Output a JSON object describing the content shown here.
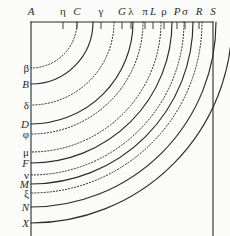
{
  "figure": {
    "background_color": "#fbfbf9",
    "ink_color": "#2b2b2b",
    "center": {
      "x": 31,
      "y": 22
    },
    "frame": {
      "left": 31,
      "top": 22,
      "right": 213,
      "bottom": 236
    }
  },
  "top_axis": {
    "name": "top-horizontal-line",
    "origin_label": "A",
    "labels": [
      {
        "text": "A",
        "x": 31,
        "tick": false,
        "style": "latin"
      },
      {
        "text": "η",
        "x": 63,
        "tick": true,
        "style": "greek"
      },
      {
        "text": "C",
        "x": 77,
        "tick": true,
        "style": "latin"
      },
      {
        "text": "γ",
        "x": 101,
        "tick": true,
        "style": "greek"
      },
      {
        "text": "G",
        "x": 122,
        "tick": true,
        "style": "latin"
      },
      {
        "text": "λ",
        "x": 131,
        "tick": true,
        "style": "greek"
      },
      {
        "text": "π",
        "x": 145,
        "tick": true,
        "style": "greek"
      },
      {
        "text": "L",
        "x": 153,
        "tick": true,
        "style": "latin"
      },
      {
        "text": "ρ",
        "x": 164,
        "tick": true,
        "style": "greek"
      },
      {
        "text": "P",
        "x": 177,
        "tick": true,
        "style": "latin"
      },
      {
        "text": "σ",
        "x": 185,
        "tick": true,
        "style": "greek"
      },
      {
        "text": "R",
        "x": 199,
        "tick": true,
        "style": "latin"
      },
      {
        "text": "S",
        "x": 213,
        "tick": false,
        "style": "latin"
      }
    ]
  },
  "left_axis": {
    "name": "left-vertical-line",
    "labels": [
      {
        "text": "β",
        "y": 68,
        "style": "greek"
      },
      {
        "text": "B",
        "y": 84,
        "style": "latin"
      },
      {
        "text": "δ",
        "y": 105,
        "style": "greek"
      },
      {
        "text": "D",
        "y": 124,
        "style": "latin"
      },
      {
        "text": "φ",
        "y": 134,
        "style": "greek"
      },
      {
        "text": "μ",
        "y": 152,
        "style": "greek"
      },
      {
        "text": "F",
        "y": 163,
        "style": "latin"
      },
      {
        "text": "ν",
        "y": 175,
        "style": "greek"
      },
      {
        "text": "M",
        "y": 184,
        "style": "latin"
      },
      {
        "text": "ξ",
        "y": 193,
        "style": "greek"
      },
      {
        "text": "N",
        "y": 207,
        "style": "latin"
      },
      {
        "text": "X",
        "y": 223,
        "style": "latin"
      }
    ]
  },
  "arcs": [
    {
      "name": "arc-beta",
      "radius": 46,
      "dash": "dotted",
      "top_label": "η",
      "left_label": "β"
    },
    {
      "name": "arc-B",
      "radius": 62,
      "dash": "solid",
      "top_label": "C",
      "left_label": "B"
    },
    {
      "name": "arc-delta",
      "radius": 83,
      "dash": "dotted",
      "top_label": "γ",
      "left_label": "δ"
    },
    {
      "name": "arc-D",
      "radius": 102,
      "dash": "solid",
      "top_label": "G",
      "left_label": "D"
    },
    {
      "name": "arc-phi",
      "radius": 112,
      "dash": "dotted",
      "top_label": "λ",
      "left_label": "φ"
    },
    {
      "name": "arc-mu",
      "radius": 130,
      "dash": "dotted",
      "top_label": "π",
      "left_label": "μ"
    },
    {
      "name": "arc-F",
      "radius": 141,
      "dash": "solid",
      "top_label": "L",
      "left_label": "F"
    },
    {
      "name": "arc-nu",
      "radius": 153,
      "dash": "dotted",
      "top_label": "ρ",
      "left_label": "ν"
    },
    {
      "name": "arc-M",
      "radius": 162,
      "dash": "solid",
      "top_label": "P",
      "left_label": "M"
    },
    {
      "name": "arc-xi",
      "radius": 171,
      "dash": "dotted",
      "top_label": "σ",
      "left_label": "ξ"
    },
    {
      "name": "arc-N",
      "radius": 185,
      "dash": "solid",
      "top_label": "R",
      "left_label": "N"
    },
    {
      "name": "arc-X",
      "radius": 201,
      "dash": "solid",
      "top_label": "S",
      "left_label": "X"
    }
  ]
}
